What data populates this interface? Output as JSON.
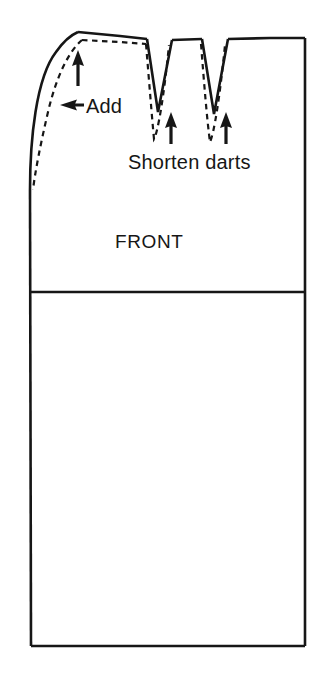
{
  "figure": {
    "kind": "sewing-pattern-alteration-diagram",
    "background_color": "#ffffff",
    "line_color": "#161616",
    "text_color": "#161616"
  },
  "labels": {
    "add": "Add",
    "add_arrow": "←",
    "add_full": "← Add",
    "shorten_darts": "Shorten darts",
    "front": "FRONT"
  },
  "annotations": {
    "arrow_up_shoulder": "up-arrow",
    "arrow_left_side_seam": "left-arrow",
    "arrow_up_dart_left": "up-arrow",
    "arrow_up_dart_right": "up-arrow"
  },
  "geometry": {
    "outline": {
      "left_edge_x": 30,
      "right_edge_x": 305,
      "top_apex": [
        78,
        32
      ],
      "bottom_y": 646,
      "waist_divider_y": 292
    },
    "darts": [
      {
        "name": "dart-left",
        "top_left_x": 147,
        "top_right_x": 172,
        "solid_tip_y": 112,
        "dashed_tip_y": 141
      },
      {
        "name": "dart-right",
        "top_left_x": 202,
        "top_right_x": 228,
        "solid_tip_y": 114,
        "dashed_tip_y": 143
      }
    ],
    "dashed_line": {
      "description": "original pattern line, inside solid altered line",
      "start": [
        80,
        38
      ],
      "end": [
        33,
        190
      ]
    }
  }
}
